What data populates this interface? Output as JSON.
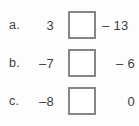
{
  "worksheet": {
    "type": "fill-in-the-blank-arithmetic",
    "rows": [
      {
        "label": "a.",
        "left_operand": "3",
        "answer_box_value": "",
        "right_operand": "– 13"
      },
      {
        "label": "b.",
        "left_operand": "–7",
        "answer_box_value": "",
        "right_operand": "– 6"
      },
      {
        "label": "c.",
        "left_operand": "–8",
        "answer_box_value": "",
        "right_operand": "0"
      }
    ],
    "colors": {
      "background": "#fdfdfd",
      "text": "#3f3f3f",
      "box_border": "#868686",
      "box_fill": "#ffffff"
    }
  }
}
